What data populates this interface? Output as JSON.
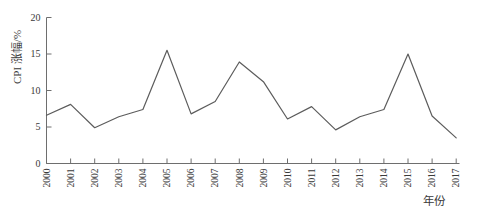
{
  "chart_data": {
    "type": "line",
    "title": "",
    "ylabel": "CPI 涨幅/%",
    "xlabel": "年份",
    "categories": [
      "2000",
      "2001",
      "2002",
      "2003",
      "2004",
      "2005",
      "2006",
      "2007",
      "2008",
      "2009",
      "2010",
      "2011",
      "2012",
      "2013",
      "2014",
      "2015",
      "2016",
      "2017"
    ],
    "values": [
      6.6,
      8.1,
      4.9,
      6.4,
      7.4,
      15.5,
      6.8,
      8.5,
      13.9,
      11.2,
      6.1,
      7.8,
      4.6,
      6.4,
      7.4,
      15.0,
      6.5,
      3.5
    ],
    "yticks": [
      0,
      5,
      10,
      15,
      20
    ],
    "ylim": [
      0,
      20
    ],
    "xrange": [
      "2000",
      "2017"
    ],
    "grid": false,
    "legend": "none",
    "line_color": "#5c5c5c",
    "axis_color": "#6e6e6e",
    "text_color": "#3a3a3a"
  }
}
